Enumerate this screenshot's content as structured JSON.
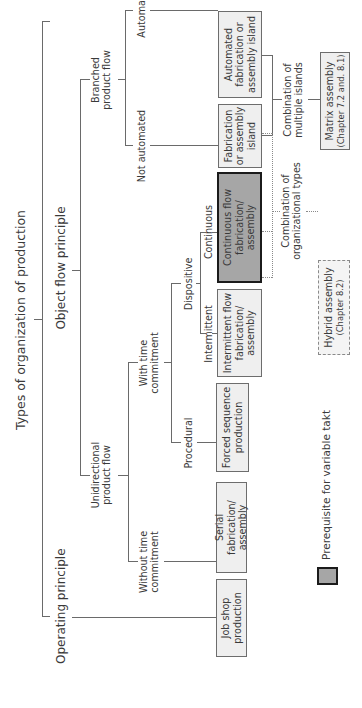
{
  "diagram": {
    "orientation": "rotated 90 degrees counter-clockwise",
    "title": "Types of organization of production",
    "level1": {
      "operating": "Operating principle",
      "object_flow": "Object flow principle"
    },
    "level2": {
      "unidirectional": "Unidirectional product flow",
      "branched": "Branched product flow"
    },
    "level3": {
      "without_time": "Without time commitment",
      "with_time": "With time commitment",
      "not_automated": "Not automated",
      "automated": "Automated"
    },
    "level4": {
      "procedural": "Procedural",
      "dispositive": "Dispositive"
    },
    "level5": {
      "intermittent": "Intermittent",
      "continuous": "Continuous"
    },
    "boxes": {
      "job_shop": "Job shop production",
      "serial": "Serial fabrication/ assembly",
      "forced_sequence": "Forced sequence production",
      "intermittent_flow": "Intermittent flow fabrication/ assembly",
      "continuous_flow": "Continuous flow fabrication/ assembly",
      "fabrication_island": "Fabrication or assembly island",
      "automated_island": "Automated fabrication or assembly island"
    },
    "combinations": {
      "org_types_label": "Combination of organizational types",
      "multi_islands_label": "Combination of multiple islands",
      "hybrid_title": "Hybrid assembly",
      "hybrid_ref": "(Chapter 8.2)",
      "matrix_title": "Matrix assembly",
      "matrix_ref": "(Chapter 7.2 and. 8.1)"
    },
    "legend": {
      "label": "Prerequisite for variable takt",
      "swatch_color": "#a6a6a6"
    },
    "colors": {
      "box_fill": "#efefef",
      "highlight_fill": "#a6a6a6",
      "line": "#6a6a6a",
      "text": "#3a3a3a"
    }
  }
}
